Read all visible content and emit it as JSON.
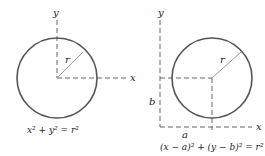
{
  "diagrams": [
    {
      "name": "origin-circle",
      "axis_x_label": "x",
      "axis_y_label": "y",
      "radius_label": "r",
      "equation": "x² + y² = r²"
    },
    {
      "name": "shifted-circle",
      "axis_x_label": "x",
      "axis_y_label": "y",
      "radius_label": "r",
      "offset_x_label": "a",
      "offset_y_label": "b",
      "equation": "(x − a)² + (y − b)² = r²"
    }
  ],
  "colors": {
    "circle": "#555555",
    "axes": "#666666",
    "radius": "#999999"
  }
}
